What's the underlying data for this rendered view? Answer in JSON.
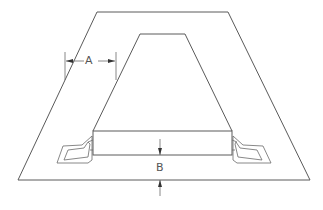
{
  "diagram": {
    "type": "technical-drawing",
    "line_color": "#5a5a5a",
    "background": "#ffffff",
    "labels": {
      "dimension_a": "A",
      "dimension_b": "B"
    },
    "shapes": {
      "outer_trapezoid": [
        [
          97,
          12
        ],
        [
          228,
          12
        ],
        [
          310,
          180
        ],
        [
          18,
          180
        ]
      ],
      "inner_trapezoid": [
        [
          140,
          34
        ],
        [
          185,
          34
        ],
        [
          232,
          131
        ],
        [
          93,
          131
        ]
      ],
      "base_block": {
        "x": 93,
        "y": 131,
        "width": 139,
        "height": 24
      }
    },
    "dimensions": {
      "a": {
        "from_x": 65,
        "to_x": 116,
        "y": 61
      },
      "b": {
        "x": 160,
        "top_y": 155,
        "bottom_y": 180
      }
    }
  }
}
